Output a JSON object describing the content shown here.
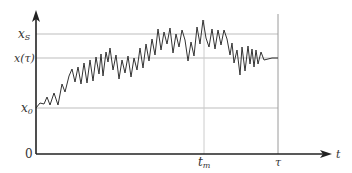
{
  "chart_data": {
    "type": "line",
    "title": "",
    "xlabel": "t",
    "ylabel": "",
    "origin_label": "0",
    "y_reference_lines": [
      {
        "label": "x_S",
        "display": "x",
        "sub": "S",
        "level": "x_S"
      },
      {
        "label": "x(τ)",
        "display": "x(τ)",
        "sub": "",
        "level": "x_tau"
      },
      {
        "label": "x_0",
        "display": "x",
        "sub": "0",
        "level": "x_0"
      }
    ],
    "x_reference_lines": [
      {
        "label": "t_m",
        "display": "t",
        "sub": "m"
      },
      {
        "label": "τ",
        "display": "τ",
        "sub": ""
      }
    ],
    "series": [
      {
        "name": "x(t)",
        "points_px": [
          [
            36,
            108
          ],
          [
            40,
            103
          ],
          [
            44,
            104
          ],
          [
            47,
            97
          ],
          [
            50,
            105
          ],
          [
            54,
            93
          ],
          [
            58,
            105
          ],
          [
            62,
            84
          ],
          [
            65,
            92
          ],
          [
            69,
            76
          ],
          [
            72,
            69
          ],
          [
            75,
            82
          ],
          [
            78,
            67
          ],
          [
            81,
            84
          ],
          [
            84,
            63
          ],
          [
            87,
            83
          ],
          [
            90,
            60
          ],
          [
            93,
            81
          ],
          [
            96,
            57
          ],
          [
            99,
            74
          ],
          [
            101,
            54
          ],
          [
            103,
            76
          ],
          [
            106,
            52
          ],
          [
            108,
            62
          ],
          [
            110,
            48
          ],
          [
            113,
            70
          ],
          [
            116,
            55
          ],
          [
            119,
            79
          ],
          [
            122,
            60
          ],
          [
            125,
            73
          ],
          [
            128,
            56
          ],
          [
            131,
            77
          ],
          [
            134,
            58
          ],
          [
            137,
            70
          ],
          [
            140,
            48
          ],
          [
            143,
            68
          ],
          [
            146,
            44
          ],
          [
            149,
            61
          ],
          [
            152,
            39
          ],
          [
            155,
            55
          ],
          [
            158,
            29
          ],
          [
            161,
            50
          ],
          [
            164,
            32
          ],
          [
            167,
            44
          ],
          [
            170,
            28
          ],
          [
            173,
            53
          ],
          [
            176,
            34
          ],
          [
            179,
            47
          ],
          [
            182,
            30
          ],
          [
            185,
            40
          ],
          [
            188,
            61
          ],
          [
            191,
            42
          ],
          [
            194,
            56
          ],
          [
            197,
            27
          ],
          [
            200,
            44
          ],
          [
            203,
            20
          ],
          [
            206,
            38
          ],
          [
            209,
            47
          ],
          [
            212,
            29
          ],
          [
            215,
            49
          ],
          [
            218,
            30
          ],
          [
            221,
            45
          ],
          [
            224,
            30
          ],
          [
            227,
            39
          ],
          [
            230,
            55
          ],
          [
            232,
            43
          ],
          [
            234,
            63
          ],
          [
            237,
            50
          ],
          [
            240,
            75
          ],
          [
            242,
            47
          ],
          [
            245,
            71
          ],
          [
            248,
            46
          ],
          [
            250,
            64
          ],
          [
            252,
            49
          ],
          [
            254,
            67
          ],
          [
            256,
            50
          ],
          [
            258,
            64
          ],
          [
            261,
            52
          ],
          [
            264,
            60
          ],
          [
            268,
            59
          ],
          [
            272,
            58
          ],
          [
            278,
            58
          ]
        ]
      }
    ],
    "axis_px": {
      "origin": [
        36,
        154
      ],
      "y_top": 12,
      "x_right": 330
    }
  },
  "labels": {
    "y_xs_main": "x",
    "y_xs_sub": "S",
    "y_xtau": "x(τ)",
    "y_x0_main": "x",
    "y_x0_sub": "0",
    "origin": "0",
    "x_tm_main": "t",
    "x_tm_sub": "m",
    "x_tau": "τ",
    "x_axis": "t"
  },
  "colors": {
    "axis": "#222222",
    "grid": "#bdbdbd",
    "series": "#333333"
  }
}
